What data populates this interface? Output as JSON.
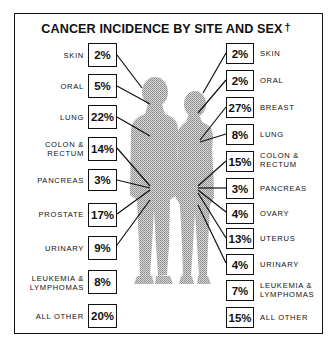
{
  "title": "CANCER INCIDENCE BY SITE AND SEX",
  "title_mark": "†",
  "male": {
    "sites": [
      {
        "label": "SKIN",
        "value": "2%"
      },
      {
        "label": "ORAL",
        "value": "5%"
      },
      {
        "label": "LUNG",
        "value": "22%"
      },
      {
        "label": "COLON & RECTUM",
        "line1": "COLON &",
        "line2": "RECTUM",
        "value": "14%"
      },
      {
        "label": "PANCREAS",
        "value": "3%"
      },
      {
        "label": "PROSTATE",
        "value": "17%"
      },
      {
        "label": "URINARY",
        "value": "9%"
      },
      {
        "label": "LEUKEMIA & LYMPHOMAS",
        "line1": "LEUKEMIA &",
        "line2": "LYMPHOMAS",
        "value": "8%"
      },
      {
        "label": "ALL OTHER",
        "value": "20%"
      }
    ]
  },
  "female": {
    "sites": [
      {
        "label": "SKIN",
        "value": "2%"
      },
      {
        "label": "ORAL",
        "value": "2%"
      },
      {
        "label": "BREAST",
        "value": "27%"
      },
      {
        "label": "LUNG",
        "value": "8%"
      },
      {
        "label": "COLON & RECTUM",
        "line1": "COLON &",
        "line2": "RECTUM",
        "value": "15%"
      },
      {
        "label": "PANCREAS",
        "value": "3%"
      },
      {
        "label": "OVARY",
        "value": "4%"
      },
      {
        "label": "UTERUS",
        "value": "13%"
      },
      {
        "label": "URINARY",
        "value": "4%"
      },
      {
        "label": "LEUKEMIA & LYMPHOMAS",
        "line1": "LEUKEMIA &",
        "line2": "LYMPHOMAS",
        "value": "7%"
      },
      {
        "label": "ALL OTHER",
        "value": "15%"
      }
    ]
  },
  "colors": {
    "ink": "#111111",
    "figure": "#b8b8b8",
    "background": "#ffffff"
  }
}
